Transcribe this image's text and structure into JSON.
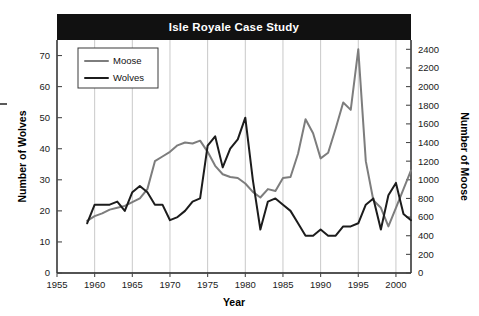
{
  "chart_data": {
    "type": "line",
    "title": "Isle Royale Case Study",
    "xlabel": "Year",
    "ylabel": "Number of Wolves",
    "y2label": "Number of Moose",
    "xlim": [
      1955,
      2002
    ],
    "xticks": [
      1955,
      1960,
      1965,
      1970,
      1975,
      1980,
      1985,
      1990,
      1995,
      2000
    ],
    "ylim": [
      0,
      75
    ],
    "yticks": [
      0,
      10,
      20,
      30,
      40,
      50,
      60,
      70
    ],
    "y2lim": [
      0,
      2500
    ],
    "y2ticks": [
      0,
      200,
      400,
      600,
      800,
      1000,
      1200,
      1400,
      1600,
      1800,
      2000,
      2200,
      2400
    ],
    "grid": "vertical",
    "legend_position": "top-left",
    "legend": [
      "Moose",
      "Wolves"
    ],
    "colors": {
      "moose": "#7d7d7d",
      "wolves": "#1c1c1c",
      "title_bar": "#111111",
      "title_text": "#ffffff",
      "gridline": "#c9c9c9",
      "axis": "#1a1a1a"
    },
    "x": [
      1959,
      1960,
      1961,
      1962,
      1963,
      1964,
      1965,
      1966,
      1967,
      1968,
      1969,
      1970,
      1971,
      1972,
      1973,
      1974,
      1975,
      1976,
      1977,
      1978,
      1979,
      1980,
      1981,
      1982,
      1983,
      1984,
      1985,
      1986,
      1987,
      1988,
      1989,
      1990,
      1991,
      1992,
      1993,
      1994,
      1995,
      1996,
      1997,
      1998,
      1999,
      2000,
      2001,
      2002
    ],
    "series": [
      {
        "name": "Moose",
        "axis": "right",
        "unit": "moose",
        "values": [
          560,
          610,
          640,
          680,
          700,
          720,
          760,
          800,
          900,
          1200,
          1250,
          1300,
          1370,
          1400,
          1390,
          1420,
          1300,
          1150,
          1060,
          1030,
          1020,
          960,
          870,
          810,
          900,
          880,
          1020,
          1030,
          1280,
          1650,
          1500,
          1230,
          1290,
          1550,
          1830,
          1750,
          2400,
          1200,
          780,
          700,
          500,
          700,
          900,
          1100
        ]
      },
      {
        "name": "Wolves",
        "axis": "left",
        "unit": "wolves",
        "values": [
          16,
          22,
          22,
          22,
          23,
          20,
          26,
          28,
          26,
          22,
          22,
          17,
          18,
          20,
          23,
          24,
          41,
          44,
          34,
          40,
          43,
          50,
          30,
          14,
          23,
          24,
          22,
          20,
          16,
          12,
          12,
          14,
          12,
          12,
          15,
          15,
          16,
          22,
          24,
          14,
          25,
          29,
          19,
          17
        ]
      }
    ]
  }
}
